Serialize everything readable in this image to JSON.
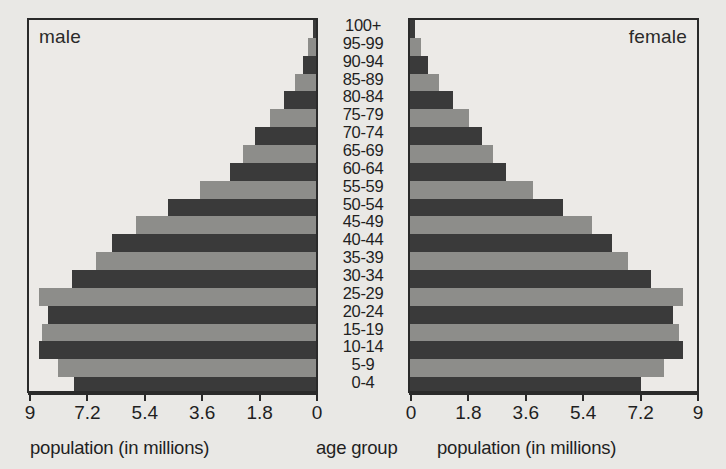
{
  "chart_data": {
    "type": "bar",
    "title": "",
    "subtitle": "",
    "orientation": "horizontal",
    "layout": "population-pyramid",
    "categories": [
      "100+",
      "95-99",
      "90-94",
      "85-89",
      "80-84",
      "75-79",
      "70-74",
      "65-69",
      "60-64",
      "55-59",
      "50-54",
      "45-49",
      "40-44",
      "35-39",
      "30-34",
      "25-29",
      "20-24",
      "15-19",
      "10-14",
      "5-9",
      "0-4"
    ],
    "series": [
      {
        "name": "male",
        "side": "left",
        "values": [
          0.1,
          0.25,
          0.4,
          0.65,
          1.0,
          1.45,
          1.9,
          2.3,
          2.7,
          3.65,
          4.65,
          5.65,
          6.4,
          6.9,
          7.65,
          8.7,
          8.4,
          8.6,
          8.7,
          8.1,
          7.6
        ]
      },
      {
        "name": "female",
        "side": "right",
        "values": [
          0.15,
          0.35,
          0.55,
          0.9,
          1.35,
          1.85,
          2.25,
          2.6,
          3.0,
          3.85,
          4.8,
          5.7,
          6.35,
          6.85,
          7.55,
          8.55,
          8.25,
          8.45,
          8.55,
          7.95,
          7.25
        ]
      }
    ],
    "xlabel": "population (in millions)",
    "ylabel": "age group",
    "xlim": [
      0,
      9
    ],
    "xticks": [
      0,
      1.8,
      3.6,
      5.4,
      7.2,
      9
    ],
    "grid": false,
    "legend": "inside-panel-titles",
    "colors": {
      "dark": "#3a3a3a",
      "light": "#8d8d8a",
      "background": "#e9e8e5",
      "axis": "#2a2a2a"
    }
  },
  "panels": {
    "male": {
      "title": "male",
      "axis_caption": "population (in millions)",
      "tick_labels": [
        "9",
        "7.2",
        "5.4",
        "3.6",
        "1.8",
        "0"
      ]
    },
    "female": {
      "title": "female",
      "axis_caption": "population (in millions)",
      "tick_labels": [
        "0",
        "1.8",
        "3.6",
        "5.4",
        "7.2",
        "9"
      ]
    }
  },
  "center": {
    "axis_caption": "age group"
  }
}
